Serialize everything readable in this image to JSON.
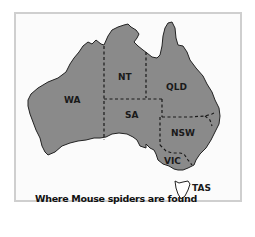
{
  "map": {
    "caption": "Where Mouse spiders are found",
    "fill_color": "#8a8a8a",
    "outline_color": "#222222",
    "states": [
      {
        "id": "wa",
        "label": "WA"
      },
      {
        "id": "nt",
        "label": "NT"
      },
      {
        "id": "qld",
        "label": "QLD"
      },
      {
        "id": "sa",
        "label": "SA"
      },
      {
        "id": "nsw",
        "label": "NSW"
      },
      {
        "id": "vic",
        "label": "VIC"
      },
      {
        "id": "tas",
        "label": "TAS"
      }
    ]
  }
}
